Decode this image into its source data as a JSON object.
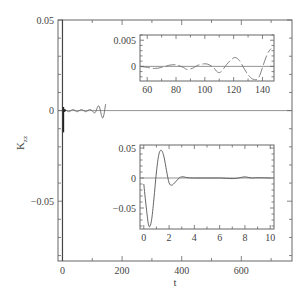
{
  "chart_data": [
    {
      "id": "main",
      "type": "line",
      "title": "",
      "xlabel": "t",
      "ylabel": "K_zz",
      "xlim": [
        -15,
        770
      ],
      "ylim": [
        -0.083,
        0.05
      ],
      "xticks": [
        0,
        200,
        400,
        600
      ],
      "yticks": [
        0.05,
        0,
        -0.05
      ],
      "ytick_labels": [
        "0.05",
        "0",
        "−0.05"
      ],
      "grid": false,
      "reference_line_y": 0,
      "series": [
        {
          "name": "K_zz",
          "description": "Sharp transient near t=0 spanning approx -0.083 to 0.05, then small oscillations up to t~145, decays to ~0",
          "x": [
            0,
            0.5,
            1,
            1.5,
            2,
            3,
            10,
            40,
            60,
            80,
            100,
            120,
            130,
            140,
            145
          ],
          "y": [
            -0.01,
            -0.083,
            0.0,
            0.046,
            -0.012,
            0.0,
            0.0,
            0.0,
            0.0,
            0.0002,
            0.0003,
            0.0015,
            -0.002,
            -0.001,
            0.003
          ]
        }
      ]
    },
    {
      "id": "inset_top",
      "type": "line",
      "xlim": [
        55,
        148
      ],
      "ylim": [
        -0.0028,
        0.006
      ],
      "xticks": [
        60,
        80,
        100,
        120,
        140
      ],
      "yticks": [
        0.005,
        0
      ],
      "ytick_labels": [
        "0.005",
        "0"
      ],
      "reference_line_y": 0,
      "series": [
        {
          "name": "K_zz (t=55-148)",
          "x": [
            55,
            60,
            65,
            70,
            75,
            80,
            85,
            88,
            92,
            95,
            100,
            103,
            106,
            108,
            110,
            112,
            115,
            118,
            121,
            124,
            127,
            130,
            133,
            136,
            138,
            140,
            142,
            144,
            146
          ],
          "y": [
            0.0,
            -0.0002,
            -0.0004,
            -0.0002,
            0.0002,
            0.0003,
            -0.0002,
            -0.0006,
            -0.0003,
            0.0002,
            0.0005,
            0.0003,
            -0.0002,
            -0.0009,
            -0.0012,
            -0.0008,
            0.0003,
            0.0012,
            0.0017,
            0.0011,
            -0.0003,
            -0.0016,
            -0.0024,
            -0.0025,
            -0.0018,
            -0.0002,
            0.0014,
            0.0027,
            0.0034
          ]
        }
      ]
    },
    {
      "id": "inset_bottom",
      "type": "line",
      "xlim": [
        -0.3,
        10.3
      ],
      "ylim": [
        -0.085,
        0.055
      ],
      "xticks": [
        0,
        2,
        4,
        6,
        8,
        10
      ],
      "yticks": [
        0.05,
        0,
        -0.05
      ],
      "ytick_labels": [
        "0.05",
        "0",
        "−0.05"
      ],
      "reference_line_y": 0,
      "series": [
        {
          "name": "K_zz (t=0-10)",
          "x": [
            0,
            0.2,
            0.4,
            0.6,
            0.8,
            1.0,
            1.2,
            1.4,
            1.6,
            1.8,
            2.0,
            2.2,
            2.4,
            2.7,
            3.0,
            3.5,
            4,
            5,
            6,
            7,
            7.5,
            8,
            8.5,
            9,
            10
          ],
          "y": [
            -0.01,
            -0.05,
            -0.08,
            -0.072,
            -0.035,
            0.01,
            0.04,
            0.046,
            0.035,
            0.012,
            -0.008,
            -0.012,
            -0.009,
            -0.002,
            0.002,
            0.0005,
            0.0,
            0.0,
            0.0,
            -0.001,
            0.0,
            0.002,
            0.0,
            0.0005,
            0.0
          ]
        }
      ]
    }
  ],
  "labels": {
    "xlabel": "t",
    "ylabel_main": "K",
    "ylabel_sub": "zz"
  }
}
